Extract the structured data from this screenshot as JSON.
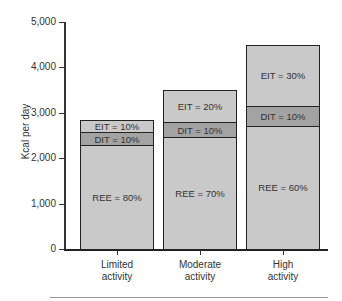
{
  "chart_data": {
    "type": "bar",
    "stacked": true,
    "title": "",
    "xlabel": "",
    "ylabel": "Kcal per day",
    "ylim": [
      0,
      5000
    ],
    "yticks": [
      "0",
      "1,000",
      "2,000",
      "3,000",
      "4,000",
      "5,000"
    ],
    "categories": [
      "Limited activity",
      "Moderate activity",
      "High activity"
    ],
    "category_lines": [
      [
        "Limited",
        "activity"
      ],
      [
        "Moderate",
        "activity"
      ],
      [
        "High",
        "activity"
      ]
    ],
    "totals": [
      2850,
      3500,
      4500
    ],
    "series": [
      {
        "name": "REE",
        "percent": [
          80,
          70,
          60
        ],
        "values": [
          2280,
          2450,
          2700
        ],
        "labels": [
          "REE = 80%",
          "REE = 70%",
          "REE = 60%"
        ],
        "color": "#c9c9c9"
      },
      {
        "name": "DIT",
        "percent": [
          10,
          10,
          10
        ],
        "values": [
          285,
          350,
          450
        ],
        "labels": [
          "DIT = 10%",
          "DIT = 10%",
          "DIT = 10%"
        ],
        "color": "#a3a3a3"
      },
      {
        "name": "EIT",
        "percent": [
          10,
          20,
          30
        ],
        "values": [
          285,
          700,
          1350
        ],
        "labels": [
          "EIT = 10%",
          "EIT = 20%",
          "EIT = 30%"
        ],
        "color": "#c9c9c9"
      }
    ],
    "grid": false,
    "legend": "none"
  }
}
